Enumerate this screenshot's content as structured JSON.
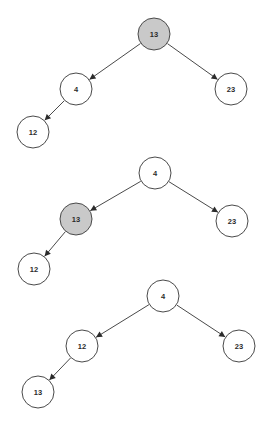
{
  "figure": {
    "title": "",
    "background_color": "#ffffff",
    "node_stroke_color": "#4a4a4a",
    "node_fill_default": "#ffffff",
    "node_fill_highlight": "#c9c9c9",
    "edge_color": "#4a4a4a",
    "label_color": "#2b2b2b",
    "width": 276,
    "height": 429
  },
  "trees": [
    {
      "id": "tree-step-1",
      "caption": "",
      "nodes": [
        {
          "id": "t1-n13",
          "label": "13",
          "cx": 154,
          "cy": 34,
          "r": 16,
          "highlighted": true
        },
        {
          "id": "t1-n4",
          "label": "4",
          "cx": 76,
          "cy": 89,
          "r": 16,
          "highlighted": false
        },
        {
          "id": "t1-n23",
          "label": "23",
          "cx": 231,
          "cy": 89,
          "r": 16,
          "highlighted": false
        },
        {
          "id": "t1-n12",
          "label": "12",
          "cx": 33,
          "cy": 132,
          "r": 16,
          "highlighted": false
        }
      ],
      "edges": [
        {
          "id": "t1-e1",
          "from": "t1-n13",
          "to": "t1-n4",
          "direction": "left"
        },
        {
          "id": "t1-e2",
          "from": "t1-n13",
          "to": "t1-n23",
          "direction": "right"
        },
        {
          "id": "t1-e3",
          "from": "t1-n4",
          "to": "t1-n12",
          "direction": "left"
        }
      ]
    },
    {
      "id": "tree-step-2",
      "caption": "",
      "nodes": [
        {
          "id": "t2-n4",
          "label": "4",
          "cx": 155,
          "cy": 173,
          "r": 16,
          "highlighted": false
        },
        {
          "id": "t2-n13",
          "label": "13",
          "cx": 76,
          "cy": 219,
          "r": 16,
          "highlighted": true
        },
        {
          "id": "t2-n23",
          "label": "23",
          "cx": 232,
          "cy": 221,
          "r": 16,
          "highlighted": false
        },
        {
          "id": "t2-n12",
          "label": "12",
          "cx": 34,
          "cy": 269,
          "r": 16,
          "highlighted": false
        }
      ],
      "edges": [
        {
          "id": "t2-e1",
          "from": "t2-n4",
          "to": "t2-n13",
          "direction": "left"
        },
        {
          "id": "t2-e2",
          "from": "t2-n4",
          "to": "t2-n23",
          "direction": "right"
        },
        {
          "id": "t2-e3",
          "from": "t2-n13",
          "to": "t2-n12",
          "direction": "left"
        }
      ]
    },
    {
      "id": "tree-step-3",
      "caption": "",
      "nodes": [
        {
          "id": "t3-n4",
          "label": "4",
          "cx": 163,
          "cy": 296,
          "r": 16,
          "highlighted": false
        },
        {
          "id": "t3-n12",
          "label": "12",
          "cx": 82,
          "cy": 346,
          "r": 16,
          "highlighted": false
        },
        {
          "id": "t3-n23",
          "label": "23",
          "cx": 239,
          "cy": 346,
          "r": 16,
          "highlighted": false
        },
        {
          "id": "t3-n13",
          "label": "13",
          "cx": 38,
          "cy": 392,
          "r": 16,
          "highlighted": false
        }
      ],
      "edges": [
        {
          "id": "t3-e1",
          "from": "t3-n4",
          "to": "t3-n12",
          "direction": "left"
        },
        {
          "id": "t3-e2",
          "from": "t3-n4",
          "to": "t3-n23",
          "direction": "right"
        },
        {
          "id": "t3-e3",
          "from": "t3-n12",
          "to": "t3-n13",
          "direction": "left"
        }
      ]
    }
  ]
}
